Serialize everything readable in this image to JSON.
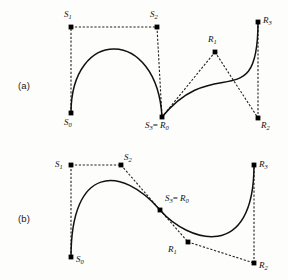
{
  "figure": {
    "background": "#fdfdfb",
    "curve_color": "#111111",
    "polygon_color": "#222222",
    "point_color": "#000000",
    "width": 288,
    "height": 280
  },
  "panels": [
    {
      "id": "a",
      "label": "(a)",
      "continuity": "C0 corner join",
      "label_pos": {
        "x": 18,
        "y": 80
      },
      "points": [
        {
          "name": "S0",
          "base": "S",
          "sub": "0",
          "x": 71,
          "y": 113,
          "label_x": 64,
          "label_y": 118,
          "marker": true
        },
        {
          "name": "S1",
          "base": "S",
          "sub": "1",
          "x": 71,
          "y": 27,
          "label_x": 64,
          "label_y": 10,
          "marker": true
        },
        {
          "name": "S2",
          "base": "S",
          "sub": "2",
          "x": 157,
          "y": 27,
          "label_x": 150,
          "label_y": 10,
          "marker": true
        },
        {
          "name": "S3=R0",
          "base": "S",
          "sub": "3",
          "eq": "= ",
          "base2": "R",
          "sub2": "0",
          "x": 162,
          "y": 117,
          "label_x": 145,
          "label_y": 121,
          "marker": true
        },
        {
          "name": "R1",
          "base": "R",
          "sub": "1",
          "x": 215,
          "y": 52,
          "label_x": 208,
          "label_y": 35,
          "marker": true
        },
        {
          "name": "R2",
          "base": "R",
          "sub": "2",
          "x": 258,
          "y": 118,
          "label_x": 261,
          "label_y": 121,
          "marker": true
        },
        {
          "name": "R3",
          "base": "R",
          "sub": "3",
          "x": 258,
          "y": 22,
          "label_x": 263,
          "label_y": 16,
          "marker": true
        }
      ]
    },
    {
      "id": "b",
      "label": "(b)",
      "continuity": "G1 smooth join",
      "label_pos": {
        "x": 18,
        "y": 213
      },
      "points": [
        {
          "name": "S0",
          "base": "S",
          "sub": "0",
          "x": 71,
          "y": 257,
          "label_x": 76,
          "label_y": 255,
          "marker": true
        },
        {
          "name": "S1",
          "base": "S",
          "sub": "1",
          "x": 71,
          "y": 165,
          "label_x": 55,
          "label_y": 160,
          "marker": true
        },
        {
          "name": "S2",
          "base": "S",
          "sub": "2",
          "x": 121,
          "y": 165,
          "label_x": 124,
          "label_y": 153,
          "marker": true
        },
        {
          "name": "S3=R0",
          "base": "S",
          "sub": "3",
          "eq": "= ",
          "base2": "R",
          "sub2": "0",
          "x": 160,
          "y": 210,
          "label_x": 165,
          "label_y": 194,
          "marker": true
        },
        {
          "name": "R1",
          "base": "R",
          "sub": "1",
          "x": 188,
          "y": 242,
          "label_x": 168,
          "label_y": 245,
          "marker": true
        },
        {
          "name": "R2",
          "base": "R",
          "sub": "2",
          "x": 254,
          "y": 263,
          "label_x": 259,
          "label_y": 261,
          "marker": true
        },
        {
          "name": "R3",
          "base": "R",
          "sub": "3",
          "x": 254,
          "y": 165,
          "label_x": 259,
          "label_y": 160,
          "marker": true
        }
      ]
    }
  ]
}
